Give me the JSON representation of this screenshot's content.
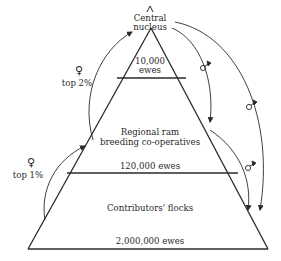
{
  "diagram": {
    "tiers": [
      {
        "name": "Central nucleus",
        "label_line1": "Central",
        "label_line2": "nucleus",
        "count_line1": "10,000",
        "count_line2": "ewes"
      },
      {
        "name": "Regional ram breeding co-operatives",
        "label_line1": "Regional ram",
        "label_line2": "breeding co-operatives",
        "count": "120,000 ewes"
      },
      {
        "name": "Contributors' flocks",
        "label": "Contributors' flocks",
        "count": "2,000,000 ewes"
      }
    ],
    "flows": {
      "female_upper": {
        "symbol": "♀",
        "text": "top 2%"
      },
      "female_lower": {
        "symbol": "♀",
        "text": "top 1%"
      },
      "male_symbol": "♂"
    },
    "colors": {
      "line": "#2a2a2a",
      "background": "#ffffff"
    }
  }
}
